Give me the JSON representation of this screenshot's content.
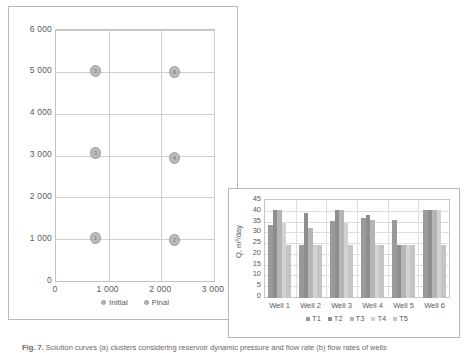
{
  "figure": {
    "caption_label": "Fig. 7.",
    "caption_text": "Solution curves (a) clusters considering reservoir dynamic pressure and flow rate (b) flow rates of wells"
  },
  "scatter": {
    "legend": [
      {
        "label": "Initial",
        "color": "#b6b6b6"
      },
      {
        "label": "Final",
        "color": "#b6b6b6"
      }
    ],
    "chart_data": {
      "type": "scatter",
      "title": "",
      "xlabel": "",
      "ylabel": "",
      "xlim": [
        0,
        3000
      ],
      "ylim": [
        0,
        6000
      ],
      "xticks": [
        "0",
        "1 000",
        "2 000",
        "3 000"
      ],
      "yticks": [
        "0",
        "1 000",
        "2 000",
        "3 000",
        "4 000",
        "5 000",
        "6 000"
      ],
      "grid": true,
      "legend_position": "bottom",
      "series": [
        {
          "name": "Initial",
          "color": "#b6b6b6",
          "points": [
            {
              "x": 750,
              "y": 5030,
              "label": "3"
            },
            {
              "x": 750,
              "y": 3060,
              "label": "3"
            },
            {
              "x": 750,
              "y": 1030,
              "label": "1"
            }
          ]
        },
        {
          "name": "Final",
          "color": "#b6b6b6",
          "points": [
            {
              "x": 2250,
              "y": 5000,
              "label": "6"
            },
            {
              "x": 2250,
              "y": 2940,
              "label": "4"
            },
            {
              "x": 2250,
              "y": 980,
              "label": "2"
            }
          ]
        }
      ]
    }
  },
  "bar": {
    "chart_data": {
      "type": "bar",
      "title": "",
      "xlabel": "",
      "ylabel": "Q, m³/day",
      "ylim": [
        0,
        45
      ],
      "yticks": [
        "0",
        "5",
        "10",
        "15",
        "20",
        "25",
        "30",
        "35",
        "40",
        "45"
      ],
      "categories": [
        "Well 1",
        "Well 2",
        "Well 3",
        "Well 4",
        "Well 5",
        "Well 6"
      ],
      "grid": true,
      "legend_position": "bottom",
      "series": [
        {
          "name": "T1",
          "color": "#9a9a9a",
          "values": [
            34,
            24.5,
            35.5,
            37,
            36,
            41
          ]
        },
        {
          "name": "T2",
          "color": "#8e8e8e",
          "values": [
            41,
            39.5,
            41,
            38.5,
            24.5,
            41
          ]
        },
        {
          "name": "T3",
          "color": "#b5b5b5",
          "values": [
            41,
            32.5,
            41,
            36,
            24.5,
            41
          ]
        },
        {
          "name": "T4",
          "color": "#d2d2d2",
          "values": [
            35,
            24.5,
            35,
            24.5,
            24.5,
            41
          ]
        },
        {
          "name": "T5",
          "color": "#c4c4c4",
          "values": [
            24.5,
            24.5,
            24.5,
            24.5,
            24.5,
            24.5
          ]
        }
      ]
    }
  }
}
